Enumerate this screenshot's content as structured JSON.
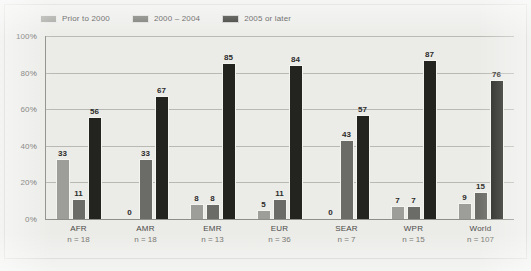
{
  "chart_data": {
    "type": "bar",
    "title": "",
    "subtitle": "",
    "xlabel": "",
    "ylabel": "",
    "ylim": [
      0,
      100
    ],
    "yticks": [
      "0%",
      "20%",
      "40%",
      "60%",
      "80%",
      "100%"
    ],
    "ytick_values": [
      0,
      20,
      40,
      60,
      80,
      100
    ],
    "grid": "horizontal",
    "legend_position": "top-left",
    "categories": [
      "AFR",
      "AMR",
      "EMR",
      "EUR",
      "SEAR",
      "WPR",
      "World"
    ],
    "category_sublabels": [
      "n = 18",
      "n = 18",
      "n = 13",
      "n = 36",
      "n = 7",
      "n = 15",
      "n = 107"
    ],
    "series": [
      {
        "name": "Prior to 2000",
        "color": "#9d9d99",
        "values": [
          33,
          0,
          8,
          5,
          0,
          7,
          9
        ]
      },
      {
        "name": "2000 – 2004",
        "color": "#6b6b67",
        "values": [
          11,
          33,
          8,
          11,
          43,
          7,
          15
        ]
      },
      {
        "name": "2005 or later",
        "color": "#23231f",
        "values": [
          56,
          67,
          85,
          84,
          57,
          87,
          76
        ]
      }
    ]
  },
  "colors": {
    "background": "#ebebe8",
    "frame_border": "#cfcfcb",
    "gridline": "#b9b9b4",
    "axis": "#8e8e89",
    "label_text": "#4a4a47",
    "value_text": "#2c2c2a",
    "series_1": "#9d9d99",
    "series_2": "#6b6b67",
    "series_3": "#23231f"
  }
}
